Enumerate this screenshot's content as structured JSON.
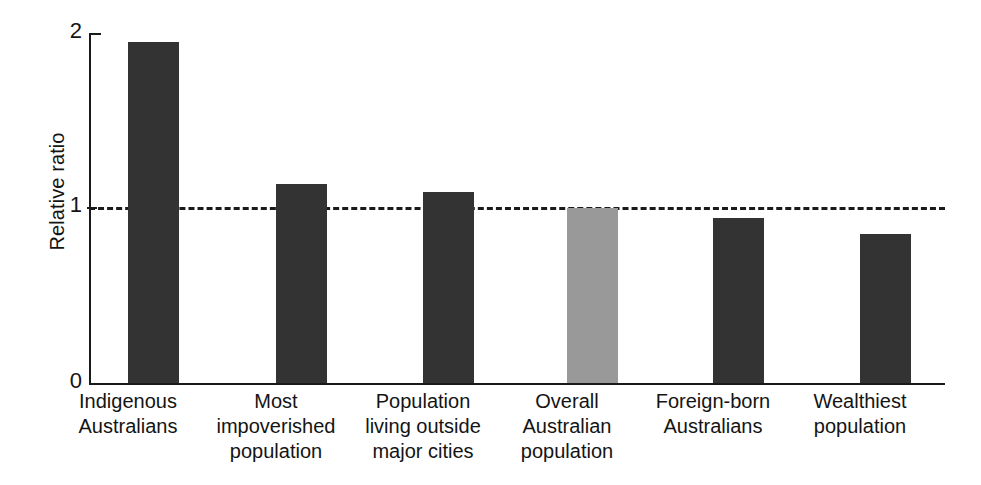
{
  "chart_data": {
    "type": "bar",
    "title": "",
    "xlabel": "",
    "ylabel": "Relative ratio",
    "ylim": [
      0,
      2
    ],
    "yticks": [
      "0",
      "1",
      "2"
    ],
    "ytick_values": [
      0,
      1,
      2
    ],
    "grid": false,
    "legend": "none",
    "reference_line": {
      "value": 1,
      "style": "dashed",
      "color": "#1a1a1a",
      "label": ""
    },
    "categories": [
      "Indigenous Australians",
      "Most impoverished population",
      "Population living outside major cities",
      "Overall Australian population",
      "Foreign-born Australians",
      "Wealthiest population"
    ],
    "category_lines": [
      [
        "Indigenous",
        "Australians"
      ],
      [
        "Most",
        "impoverished",
        "population"
      ],
      [
        "Population",
        "living outside",
        "major cities"
      ],
      [
        "Overall",
        "Australian",
        "population"
      ],
      [
        "Foreign-born",
        "Australians"
      ],
      [
        "Wealthiest",
        "population"
      ]
    ],
    "values": [
      1.95,
      1.14,
      1.09,
      1.0,
      0.94,
      0.85
    ],
    "bar_colors": [
      "#333333",
      "#333333",
      "#333333",
      "#999999",
      "#333333",
      "#333333"
    ],
    "colors": {
      "bar_primary": "#333333",
      "bar_highlight": "#999999",
      "axis": "#1a1a1a",
      "background": "#ffffff"
    }
  }
}
